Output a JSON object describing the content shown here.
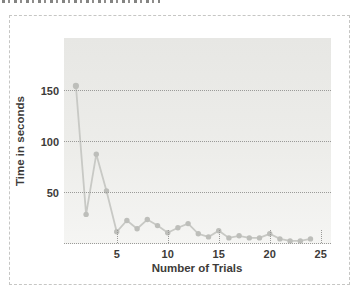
{
  "chart_data": {
    "type": "line",
    "title": "",
    "xlabel": "Number of Trials",
    "ylabel": "Time in seconds",
    "x": [
      1,
      2,
      3,
      4,
      5,
      6,
      7,
      8,
      9,
      10,
      11,
      12,
      13,
      14,
      15,
      16,
      17,
      18,
      19,
      20,
      21,
      22,
      23,
      24
    ],
    "values": [
      155,
      29,
      88,
      52,
      12,
      23,
      15,
      24,
      18,
      11,
      16,
      20,
      10,
      7,
      13,
      6,
      8,
      6,
      6,
      10,
      5,
      3,
      3,
      5
    ],
    "x_ticks": [
      5,
      10,
      15,
      20,
      25
    ],
    "y_ticks": [
      50,
      100,
      150
    ],
    "xlim": [
      0,
      26
    ],
    "ylim": [
      0,
      202
    ],
    "grid": "horizontal dotted lines at 0, 50, 100, 150; short dotted vertical stubs at labeled x ticks",
    "legend_position": "none",
    "colors": {
      "line": "#c8c9c5",
      "marker": "#bdbeba",
      "grid": "#9a9a98",
      "labels": "#3d3b39",
      "plot_background_top": "#e7e7e4",
      "plot_background_bottom": "#f5f5f3",
      "frame_border": "#c6c6c4"
    }
  }
}
